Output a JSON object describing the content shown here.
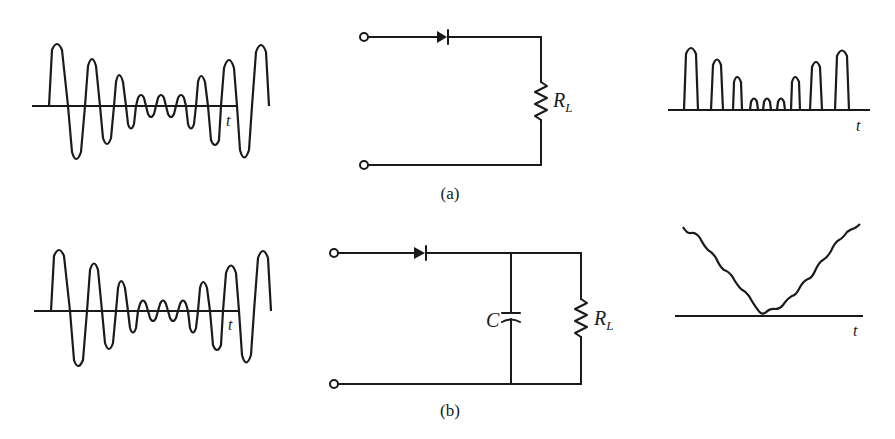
{
  "figure": {
    "panels": [
      {
        "id": "a",
        "caption": "(a)",
        "input_waveform": {
          "axis_label": "t",
          "description": "AM modulated carrier (full wave)"
        },
        "circuit": {
          "components": [
            "diode",
            "load resistor"
          ],
          "resistor_label": "R",
          "resistor_subscript": "L"
        },
        "output_waveform": {
          "axis_label": "t",
          "description": "half-wave rectified pulses"
        }
      },
      {
        "id": "b",
        "caption": "(b)",
        "input_waveform": {
          "axis_label": "t",
          "description": "AM modulated carrier (full wave)"
        },
        "circuit": {
          "components": [
            "diode",
            "capacitor",
            "load resistor"
          ],
          "capacitor_label": "C",
          "resistor_label": "R",
          "resistor_subscript": "L"
        },
        "output_waveform": {
          "axis_label": "t",
          "description": "recovered envelope with ripple"
        }
      }
    ]
  },
  "colors": {
    "ink": "#1a1a1a",
    "background": "#ffffff"
  }
}
